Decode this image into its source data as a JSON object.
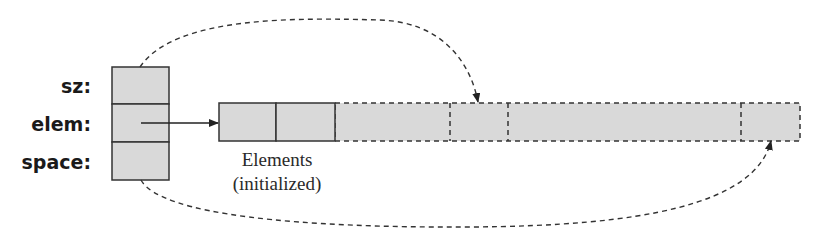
{
  "diagram": {
    "struct": {
      "fields": [
        {
          "name": "sz",
          "label": "sz:"
        },
        {
          "name": "elem",
          "label": "elem:"
        },
        {
          "name": "space",
          "label": "space:"
        }
      ]
    },
    "array": {
      "caption_line1": "Elements",
      "caption_line2": "(initialized)",
      "initialized_cells": 2,
      "segments": [
        {
          "kind": "uninitialized-region"
        },
        {
          "kind": "sz-cell"
        },
        {
          "kind": "uninitialized-region"
        },
        {
          "kind": "space-cell"
        }
      ]
    },
    "pointers": [
      {
        "from": "sz",
        "to": "sz-cell",
        "style": "dashed"
      },
      {
        "from": "elem",
        "to": "array-start",
        "style": "solid"
      },
      {
        "from": "space",
        "to": "space-cell",
        "style": "dashed"
      }
    ],
    "colors": {
      "fill": "#d9d9d9",
      "stroke": "#333333",
      "dashed_stroke": "#333333",
      "text": "#1a1a1a"
    }
  }
}
